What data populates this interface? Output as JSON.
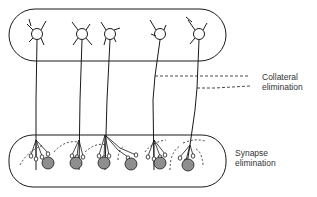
{
  "diagram": {
    "labels": {
      "collateral": [
        "Collateral",
        "elimination"
      ],
      "synapse": [
        "Synapse",
        "elimination"
      ]
    },
    "colors": {
      "stroke": "#1a1a1a",
      "target_cell_fill": "#8e8e8e",
      "background": "#ffffff"
    },
    "upper_region": {
      "neuron_count": 5
    },
    "lower_region": {
      "target_cell_count": 6
    }
  }
}
